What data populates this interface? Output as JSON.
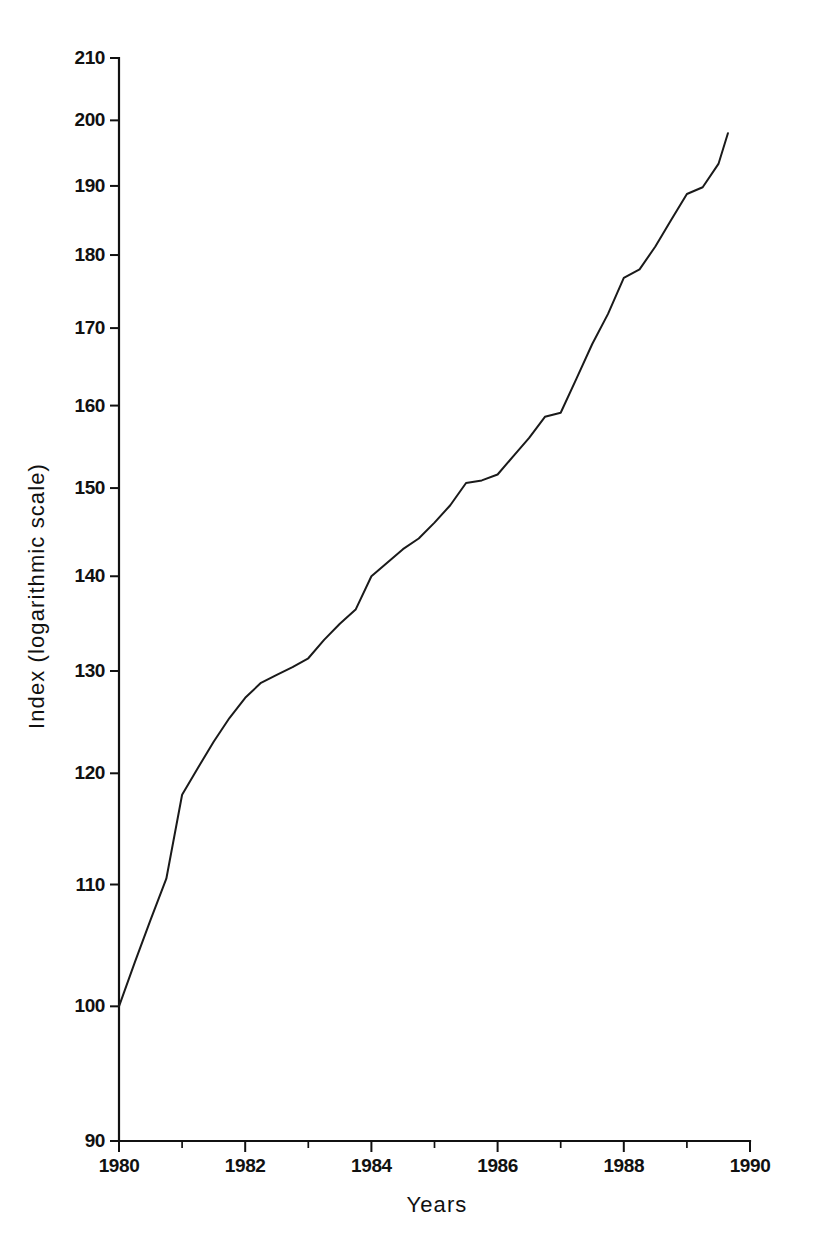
{
  "chart_data": {
    "type": "line",
    "title": "",
    "xlabel": "Years",
    "ylabel": "Index (logarithmic scale)",
    "yscale": "log",
    "xlim": [
      1980,
      1990
    ],
    "ylim": [
      90,
      210
    ],
    "grid": false,
    "legend": null,
    "y_ticks": [
      90,
      100,
      110,
      120,
      130,
      140,
      150,
      160,
      170,
      180,
      190,
      200,
      210
    ],
    "y_tick_labels": [
      "90",
      "100",
      "110",
      "120",
      "130",
      "140",
      "150",
      "160",
      "170",
      "180",
      "190",
      "200",
      "210"
    ],
    "x_ticks_major": [
      1980,
      1982,
      1984,
      1986,
      1988,
      1990
    ],
    "x_tick_labels": [
      "1980",
      "1982",
      "1984",
      "1986",
      "1988",
      "1990"
    ],
    "x_ticks_minor": [
      1981,
      1983,
      1985,
      1987,
      1989
    ],
    "series": [
      {
        "name": "Index",
        "x": [
          1980.0,
          1980.25,
          1980.5,
          1980.75,
          1981.0,
          1981.25,
          1981.5,
          1981.75,
          1982.0,
          1982.25,
          1982.5,
          1982.75,
          1983.0,
          1983.25,
          1983.5,
          1983.75,
          1984.0,
          1984.25,
          1984.5,
          1984.75,
          1985.0,
          1985.25,
          1985.5,
          1985.75,
          1986.0,
          1986.25,
          1986.5,
          1986.75,
          1987.0,
          1987.25,
          1987.5,
          1987.75,
          1988.0,
          1988.25,
          1988.5,
          1988.75,
          1989.0,
          1989.25,
          1989.5
        ],
        "y": [
          100.0,
          103.5,
          107.0,
          110.5,
          118.0,
          120.5,
          123.0,
          125.3,
          127.3,
          128.8,
          129.6,
          130.4,
          131.3,
          133.2,
          134.9,
          136.4,
          140.0,
          141.5,
          143.0,
          144.2,
          146.0,
          148.0,
          150.6,
          150.9,
          151.6,
          153.8,
          156.0,
          158.6,
          159.1,
          163.4,
          167.9,
          171.9,
          176.8,
          178.0,
          181.2,
          185.0,
          188.8,
          189.8,
          193.3
        ],
        "end_value": 198.0
      }
    ],
    "line_color": "#1a1a1a",
    "background_color": "#ffffff",
    "start_value": 100,
    "end_value": 198
  },
  "axes": {
    "y_axis_title": "Index (logarithmic scale)",
    "x_axis_title": "Years"
  }
}
